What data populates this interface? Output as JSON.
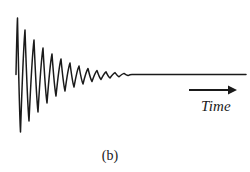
{
  "figure": {
    "caption": "(b)",
    "background_color": "#ffffff",
    "line_color": "#1a1a1a"
  },
  "axis": {
    "time_label": "Time",
    "arrow_icon": "right-arrow-icon",
    "arrow_direction": "right"
  },
  "chart_data": {
    "type": "line",
    "title": "",
    "subtitle": "",
    "xlabel": "Time",
    "ylabel": "",
    "grid": false,
    "legend": null,
    "annotations": [
      {
        "text": "Time",
        "role": "x-axis-label",
        "style": "italic"
      },
      {
        "text": "(b)",
        "role": "figure-caption"
      }
    ],
    "xlim": [
      0,
      250
    ],
    "ylim": [
      0,
      172
    ],
    "baseline_y": 74.5,
    "envelope": {
      "model": "exponential-decay",
      "initial_amplitude": 57,
      "decay_constant_px": 23.0,
      "period_px": 9.2,
      "start_x": 16,
      "oscillation_end_x": 128,
      "flat_end_x": 246
    },
    "x": [
      16,
      19.6,
      24.2,
      28.8,
      33.4,
      38,
      42.6,
      47.2,
      51.8,
      56.4,
      61,
      65.6,
      70.2,
      74.8,
      79.4,
      84,
      88.6,
      93.2,
      97.8,
      102.4,
      107,
      111.6,
      116.2,
      120.8,
      125.4,
      130,
      160,
      190,
      220,
      246
    ],
    "y": [
      74.5,
      18,
      132,
      28,
      120,
      38,
      110,
      46,
      101,
      53,
      95,
      58,
      90,
      62,
      87,
      65,
      84,
      67.5,
      82,
      69.5,
      80.5,
      71,
      79,
      72,
      77.5,
      74.5,
      74.5,
      74.5,
      74.5,
      74.5
    ],
    "points": [
      {
        "x": 16,
        "y": 74.5,
        "kind": "start"
      },
      {
        "x": 17.5,
        "y": 18,
        "kind": "peak",
        "index": 1
      },
      {
        "x": 20.5,
        "y": 132,
        "kind": "trough",
        "index": 1
      },
      {
        "x": 25,
        "y": 30,
        "kind": "peak",
        "index": 2
      },
      {
        "x": 29,
        "y": 121,
        "kind": "trough",
        "index": 2
      },
      {
        "x": 34,
        "y": 40,
        "kind": "peak",
        "index": 3
      },
      {
        "x": 38,
        "y": 112,
        "kind": "trough",
        "index": 3
      },
      {
        "x": 43,
        "y": 48,
        "kind": "peak",
        "index": 4
      },
      {
        "x": 47,
        "y": 103,
        "kind": "trough",
        "index": 4
      },
      {
        "x": 52,
        "y": 54,
        "kind": "peak",
        "index": 5
      },
      {
        "x": 56,
        "y": 96,
        "kind": "trough",
        "index": 5
      },
      {
        "x": 61,
        "y": 59,
        "kind": "peak",
        "index": 6
      },
      {
        "x": 65,
        "y": 91,
        "kind": "trough",
        "index": 6
      },
      {
        "x": 70,
        "y": 63,
        "kind": "peak",
        "index": 7
      },
      {
        "x": 74,
        "y": 87,
        "kind": "trough",
        "index": 7
      },
      {
        "x": 79,
        "y": 66,
        "kind": "peak",
        "index": 8
      },
      {
        "x": 83,
        "y": 84,
        "kind": "trough",
        "index": 8
      },
      {
        "x": 88,
        "y": 68.5,
        "kind": "peak",
        "index": 9
      },
      {
        "x": 92,
        "y": 81.5,
        "kind": "trough",
        "index": 9
      },
      {
        "x": 97,
        "y": 70.5,
        "kind": "peak",
        "index": 10
      },
      {
        "x": 101,
        "y": 79.5,
        "kind": "trough",
        "index": 10
      },
      {
        "x": 106,
        "y": 71.8,
        "kind": "peak",
        "index": 11
      },
      {
        "x": 110,
        "y": 78,
        "kind": "trough",
        "index": 11
      },
      {
        "x": 115,
        "y": 72.6,
        "kind": "peak",
        "index": 12
      },
      {
        "x": 119,
        "y": 76.8,
        "kind": "trough",
        "index": 12
      },
      {
        "x": 124,
        "y": 73.4,
        "kind": "peak",
        "index": 13
      },
      {
        "x": 128,
        "y": 75.6,
        "kind": "trough",
        "index": 13
      },
      {
        "x": 246,
        "y": 74.5,
        "kind": "end"
      }
    ]
  }
}
